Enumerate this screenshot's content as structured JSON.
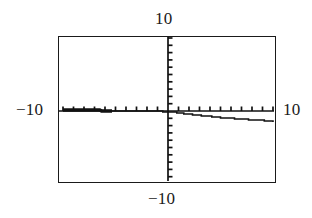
{
  "window": {
    "title": "Graphing calculator viewing window",
    "background_color": "#ffffff",
    "ink_color": "#1a1a1a"
  },
  "labels": {
    "ymax": "10",
    "xmin": "−10",
    "xmax": "10",
    "ymin": "−10"
  },
  "chart_data": {
    "type": "line",
    "title": "",
    "subtitle": "",
    "xlabel": "",
    "ylabel": "",
    "xlim": [
      -10,
      10
    ],
    "ylim": [
      -10,
      10
    ],
    "grid": false,
    "legend": null,
    "axes": {
      "x_axis_y": 0,
      "y_axis_x": 0,
      "x_tick_spacing": 1,
      "y_tick_spacing": 1,
      "x_tick_count": 20,
      "y_tick_count": 20,
      "tick_style": "hash-marks",
      "x_tick_label_text": "",
      "y_tick_label_text": ""
    },
    "series": [
      {
        "name": "curve",
        "style": "stepped-pixelated",
        "stroke": "#111111",
        "x": [
          -10.0,
          -9.0,
          -8.0,
          -7.0,
          -6.0,
          -5.0,
          -4.0,
          -3.0,
          -2.5,
          -2.0,
          -1.0,
          0.0,
          1.0,
          2.0,
          3.0,
          4.0,
          5.0,
          6.0,
          7.0,
          8.0,
          9.0,
          10.0
        ],
        "y": [
          0.15,
          0.12,
          0.1,
          0.08,
          0.06,
          0.05,
          0.03,
          0.02,
          0.0,
          -0.02,
          -0.05,
          -0.1,
          -0.25,
          -0.45,
          -0.6,
          -0.75,
          -0.9,
          -1.0,
          -1.1,
          -1.2,
          -1.3,
          -1.45
        ]
      }
    ],
    "annotations": []
  },
  "plot_geometry": {
    "frame_left": 58,
    "frame_top": 36,
    "frame_width": 218,
    "frame_height": 147,
    "origin_x": 109,
    "origin_y": 74
  }
}
